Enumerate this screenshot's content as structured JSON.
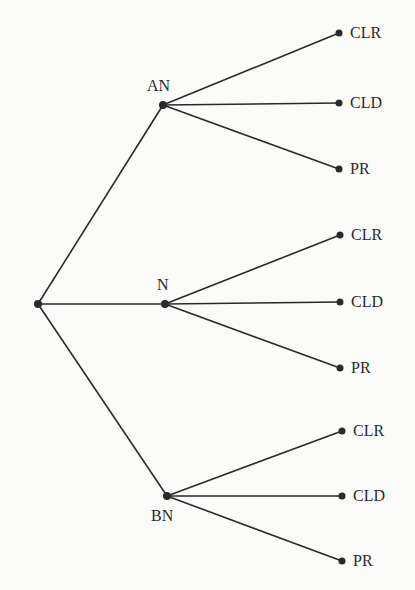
{
  "diagram": {
    "type": "decision-tree",
    "colors": {
      "line": "#2a2a2a",
      "background": "#fbfbf9"
    },
    "root": {
      "x": 38,
      "y": 304
    },
    "branches": [
      {
        "label": "AN",
        "x": 163,
        "y": 105,
        "label_pos": "above",
        "leaves": [
          {
            "label": "CLR",
            "x": 339,
            "y": 33
          },
          {
            "label": "CLD",
            "x": 339,
            "y": 103
          },
          {
            "label": "PR",
            "x": 339,
            "y": 169
          }
        ]
      },
      {
        "label": "N",
        "x": 165,
        "y": 304,
        "label_pos": "above",
        "leaves": [
          {
            "label": "CLR",
            "x": 340,
            "y": 235
          },
          {
            "label": "CLD",
            "x": 340,
            "y": 302
          },
          {
            "label": "PR",
            "x": 340,
            "y": 368
          }
        ]
      },
      {
        "label": "BN",
        "x": 167,
        "y": 496,
        "label_pos": "below",
        "leaves": [
          {
            "label": "CLR",
            "x": 342,
            "y": 431
          },
          {
            "label": "CLD",
            "x": 342,
            "y": 496
          },
          {
            "label": "PR",
            "x": 342,
            "y": 561
          }
        ]
      }
    ]
  }
}
